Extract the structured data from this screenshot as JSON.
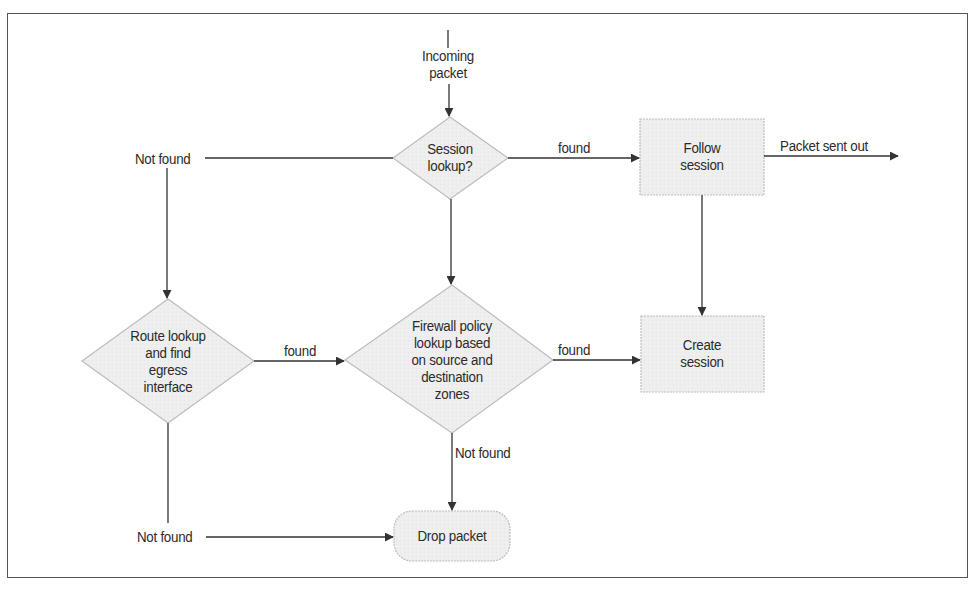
{
  "diagram": {
    "colors": {
      "shape_fill": "#eeeeee",
      "shape_stroke": "#bdbdbd",
      "line": "#333333",
      "frame": "#555555",
      "text": "#2b2b2b"
    },
    "nodes": {
      "incoming": {
        "lines": [
          "Incoming",
          "packet"
        ]
      },
      "session_lookup": {
        "shape": "diamond",
        "lines": [
          "Session",
          "lookup?"
        ]
      },
      "follow_session": {
        "shape": "rectangle",
        "lines": [
          "Follow",
          "session"
        ]
      },
      "route_lookup": {
        "shape": "diamond",
        "lines": [
          "Route lookup",
          "and find",
          "egress",
          "interface"
        ]
      },
      "policy_lookup": {
        "shape": "diamond",
        "lines": [
          "Firewall policy",
          "lookup based",
          "on source and",
          "destination",
          "zones"
        ]
      },
      "create_session": {
        "shape": "rectangle",
        "lines": [
          "Create",
          "session"
        ]
      },
      "drop_packet": {
        "shape": "rounded-rectangle",
        "lines": [
          "Drop packet"
        ]
      }
    },
    "edges": [
      {
        "from": "incoming",
        "to": "session_lookup",
        "label": ""
      },
      {
        "from": "session_lookup",
        "to": "follow_session",
        "label": "found"
      },
      {
        "from": "follow_session",
        "to": "output",
        "label": "Packet sent out"
      },
      {
        "from": "session_lookup",
        "to": "route_lookup",
        "label": "Not found"
      },
      {
        "from": "session_lookup",
        "to": "policy_lookup",
        "label": ""
      },
      {
        "from": "follow_session",
        "to": "create_session",
        "label": ""
      },
      {
        "from": "route_lookup",
        "to": "policy_lookup",
        "label": "found"
      },
      {
        "from": "policy_lookup",
        "to": "create_session",
        "label": "found"
      },
      {
        "from": "policy_lookup",
        "to": "drop_packet",
        "label": "Not found"
      },
      {
        "from": "route_lookup",
        "to": "drop_packet",
        "label": "Not found"
      }
    ]
  }
}
